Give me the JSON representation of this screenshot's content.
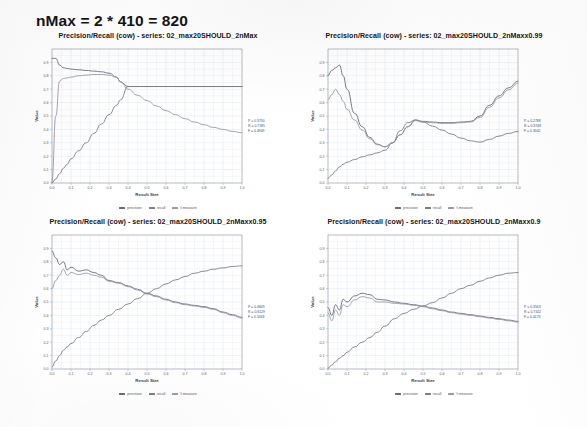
{
  "page": {
    "heading": "nMax = 2 * 410 = 820",
    "background_color": "#ffffff"
  },
  "style": {
    "grid_color": "#c9d6e8",
    "axis_color": "#8a8a94",
    "precision_color": "#6a6a78",
    "recall_color": "#7d7d8a",
    "fmeasure_color": "#9a9aa6"
  },
  "legend": {
    "entries": [
      {
        "label": "precision",
        "color": "#6a6a78"
      },
      {
        "label": "recall",
        "color": "#7d7d8a"
      },
      {
        "label": "f-measure",
        "color": "#9a9aa6"
      }
    ]
  },
  "chart_data": [
    {
      "id": "chart-top-left",
      "type": "line",
      "title": "Precision/Recall (cow) - series: 02_max20SHOULD_2nMax",
      "xlabel": "Result Size",
      "ylabel": "Value",
      "xlim": [
        0.0,
        1.0
      ],
      "ylim": [
        0.0,
        1.0
      ],
      "grid": true,
      "legend_position": "bottom",
      "xticks": [
        "0.0",
        "0.1",
        "0.2",
        "0.3",
        "0.4",
        "0.5",
        "0.6",
        "0.7",
        "0.8",
        "0.9",
        "1.0"
      ],
      "yticks": [
        "0.0",
        "0.1",
        "0.2",
        "0.3",
        "0.4",
        "0.5",
        "0.6",
        "0.7",
        "0.8",
        "0.9"
      ],
      "annotation": [
        "P = 0.3730",
        "R = 0.7185",
        "F = 0.4909"
      ],
      "x": [
        0.0,
        0.02,
        0.04,
        0.06,
        0.08,
        0.1,
        0.14,
        0.18,
        0.22,
        0.26,
        0.3,
        0.34,
        0.36,
        0.4,
        0.45,
        0.5,
        0.55,
        0.6,
        0.65,
        0.7,
        0.75,
        0.8,
        0.85,
        0.9,
        0.95,
        1.0
      ],
      "series": [
        {
          "name": "precision",
          "color": "#6a6a78",
          "values": [
            0.93,
            0.93,
            0.88,
            0.86,
            0.855,
            0.85,
            0.845,
            0.84,
            0.835,
            0.83,
            0.82,
            0.79,
            0.755,
            0.72,
            0.72,
            0.72,
            0.72,
            0.72,
            0.72,
            0.72,
            0.72,
            0.72,
            0.72,
            0.72,
            0.72,
            0.72
          ]
        },
        {
          "name": "recall",
          "color": "#7d7d8a",
          "values": [
            0.0,
            0.03,
            0.07,
            0.11,
            0.14,
            0.18,
            0.24,
            0.3,
            0.37,
            0.44,
            0.51,
            0.58,
            0.62,
            0.72,
            0.72,
            0.72,
            0.72,
            0.72,
            0.72,
            0.72,
            0.72,
            0.72,
            0.72,
            0.72,
            0.72,
            0.72
          ]
        },
        {
          "name": "f-measure",
          "color": "#9a9aa6",
          "values": [
            0.0,
            0.5,
            0.76,
            0.78,
            0.785,
            0.79,
            0.8,
            0.805,
            0.81,
            0.81,
            0.805,
            0.79,
            0.755,
            0.7,
            0.655,
            0.615,
            0.575,
            0.54,
            0.51,
            0.48,
            0.455,
            0.435,
            0.415,
            0.4,
            0.385,
            0.375
          ]
        }
      ]
    },
    {
      "id": "chart-top-right",
      "type": "line",
      "title": "Precision/Recall (cow) - series: 02_max20SHOULD_2nMaxx0.99",
      "xlabel": "Result Size",
      "ylabel": "Value",
      "xlim": [
        0.0,
        1.0
      ],
      "ylim": [
        0.0,
        1.0
      ],
      "grid": true,
      "legend_position": "bottom",
      "xticks": [
        "0.0",
        "0.1",
        "0.2",
        "0.3",
        "0.4",
        "0.5",
        "0.6",
        "0.7",
        "0.8",
        "0.9",
        "1.0"
      ],
      "yticks": [
        "0.0",
        "0.1",
        "0.2",
        "0.3",
        "0.4",
        "0.5",
        "0.6",
        "0.7",
        "0.8",
        "0.9"
      ],
      "annotation": [
        "P = 0.2788",
        "R = 0.3748",
        "F = 0.3042"
      ],
      "x": [
        0.0,
        0.02,
        0.04,
        0.06,
        0.08,
        0.1,
        0.14,
        0.18,
        0.22,
        0.26,
        0.3,
        0.34,
        0.38,
        0.42,
        0.46,
        0.5,
        0.55,
        0.6,
        0.65,
        0.7,
        0.75,
        0.8,
        0.85,
        0.9,
        0.95,
        1.0
      ],
      "series": [
        {
          "name": "precision",
          "color": "#6a6a78",
          "values": [
            0.8,
            0.84,
            0.86,
            0.88,
            0.8,
            0.7,
            0.52,
            0.42,
            0.34,
            0.29,
            0.27,
            0.3,
            0.36,
            0.42,
            0.47,
            0.46,
            0.455,
            0.45,
            0.45,
            0.455,
            0.46,
            0.5,
            0.58,
            0.65,
            0.71,
            0.76
          ]
        },
        {
          "name": "recall",
          "color": "#7d7d8a",
          "values": [
            0.035,
            0.06,
            0.09,
            0.12,
            0.14,
            0.155,
            0.175,
            0.195,
            0.21,
            0.225,
            0.245,
            0.3,
            0.39,
            0.45,
            0.47,
            0.455,
            0.425,
            0.395,
            0.365,
            0.335,
            0.315,
            0.305,
            0.325,
            0.35,
            0.37,
            0.385
          ]
        },
        {
          "name": "f-measure",
          "color": "#9a9aa6",
          "values": [
            0.62,
            0.66,
            0.7,
            0.66,
            0.61,
            0.55,
            0.47,
            0.395,
            0.33,
            0.285,
            0.27,
            0.3,
            0.36,
            0.42,
            0.465,
            0.455,
            0.45,
            0.445,
            0.445,
            0.45,
            0.455,
            0.49,
            0.565,
            0.635,
            0.695,
            0.745
          ]
        }
      ]
    },
    {
      "id": "chart-bottom-left",
      "type": "line",
      "title": "Precision/Recall (cow) - series: 02_max20SHOULD_2nMaxx0.95",
      "xlabel": "Result Size",
      "ylabel": "Value",
      "xlim": [
        0.0,
        1.0
      ],
      "ylim": [
        0.0,
        1.0
      ],
      "grid": true,
      "legend_position": "bottom",
      "xticks": [
        "0.0",
        "0.1",
        "0.2",
        "0.3",
        "0.4",
        "0.5",
        "0.6",
        "0.7",
        "0.8",
        "0.9",
        "1.0"
      ],
      "yticks": [
        "0.0",
        "0.1",
        "0.2",
        "0.3",
        "0.4",
        "0.5",
        "0.6",
        "0.7",
        "0.8",
        "0.9"
      ],
      "annotation": [
        "P = 0.4609",
        "R = 0.6129",
        "F = 0.5063"
      ],
      "x": [
        0.0,
        0.02,
        0.04,
        0.06,
        0.08,
        0.1,
        0.14,
        0.18,
        0.22,
        0.26,
        0.3,
        0.35,
        0.4,
        0.45,
        0.5,
        0.55,
        0.6,
        0.65,
        0.7,
        0.75,
        0.8,
        0.85,
        0.9,
        0.95,
        1.0
      ],
      "series": [
        {
          "name": "precision",
          "color": "#6a6a78",
          "values": [
            0.88,
            0.83,
            0.78,
            0.8,
            0.74,
            0.76,
            0.73,
            0.74,
            0.72,
            0.7,
            0.66,
            0.645,
            0.62,
            0.595,
            0.565,
            0.545,
            0.52,
            0.5,
            0.485,
            0.475,
            0.465,
            0.45,
            0.425,
            0.405,
            0.385
          ]
        },
        {
          "name": "recall",
          "color": "#7d7d8a",
          "values": [
            0.015,
            0.06,
            0.1,
            0.14,
            0.165,
            0.19,
            0.235,
            0.28,
            0.325,
            0.365,
            0.4,
            0.445,
            0.485,
            0.525,
            0.565,
            0.6,
            0.635,
            0.665,
            0.69,
            0.715,
            0.73,
            0.745,
            0.755,
            0.765,
            0.77
          ]
        },
        {
          "name": "f-measure",
          "color": "#9a9aa6",
          "values": [
            0.6,
            0.66,
            0.7,
            0.745,
            0.7,
            0.72,
            0.705,
            0.715,
            0.7,
            0.685,
            0.655,
            0.64,
            0.615,
            0.59,
            0.56,
            0.54,
            0.515,
            0.495,
            0.48,
            0.47,
            0.46,
            0.445,
            0.42,
            0.4,
            0.38
          ]
        }
      ]
    },
    {
      "id": "chart-bottom-right",
      "type": "line",
      "title": "Precision/Recall (cow) - series: 02_max20SHOULD_2nMaxx0.9",
      "xlabel": "Result Size",
      "ylabel": "Value",
      "xlim": [
        0.0,
        1.0
      ],
      "ylim": [
        0.0,
        1.0
      ],
      "grid": true,
      "legend_position": "bottom",
      "xticks": [
        "0.0",
        "0.1",
        "0.2",
        "0.3",
        "0.4",
        "0.5",
        "0.6",
        "0.7",
        "0.8",
        "0.9",
        "1.0"
      ],
      "yticks": [
        "0.0",
        "0.1",
        "0.2",
        "0.3",
        "0.4",
        "0.5",
        "0.6",
        "0.7",
        "0.8",
        "0.9"
      ],
      "annotation": [
        "P = 0.3563",
        "R = 0.7102",
        "F = 0.4173"
      ],
      "x": [
        0.0,
        0.02,
        0.04,
        0.06,
        0.08,
        0.1,
        0.14,
        0.18,
        0.22,
        0.26,
        0.3,
        0.35,
        0.4,
        0.45,
        0.5,
        0.55,
        0.6,
        0.65,
        0.7,
        0.75,
        0.8,
        0.85,
        0.9,
        0.95,
        1.0
      ],
      "series": [
        {
          "name": "precision",
          "color": "#6a6a78",
          "values": [
            0.46,
            0.4,
            0.48,
            0.44,
            0.52,
            0.5,
            0.545,
            0.565,
            0.555,
            0.52,
            0.515,
            0.5,
            0.49,
            0.48,
            0.47,
            0.455,
            0.44,
            0.425,
            0.415,
            0.405,
            0.395,
            0.385,
            0.375,
            0.365,
            0.355
          ]
        },
        {
          "name": "recall",
          "color": "#7d7d8a",
          "values": [
            0.005,
            0.03,
            0.055,
            0.08,
            0.1,
            0.125,
            0.165,
            0.2,
            0.235,
            0.275,
            0.32,
            0.375,
            0.415,
            0.445,
            0.47,
            0.495,
            0.53,
            0.565,
            0.6,
            0.625,
            0.655,
            0.68,
            0.7,
            0.715,
            0.72
          ]
        },
        {
          "name": "f-measure",
          "color": "#9a9aa6",
          "values": [
            0.42,
            0.36,
            0.44,
            0.4,
            0.48,
            0.465,
            0.515,
            0.54,
            0.53,
            0.5,
            0.5,
            0.49,
            0.485,
            0.475,
            0.465,
            0.45,
            0.435,
            0.42,
            0.41,
            0.4,
            0.39,
            0.38,
            0.37,
            0.36,
            0.35
          ]
        }
      ]
    }
  ]
}
